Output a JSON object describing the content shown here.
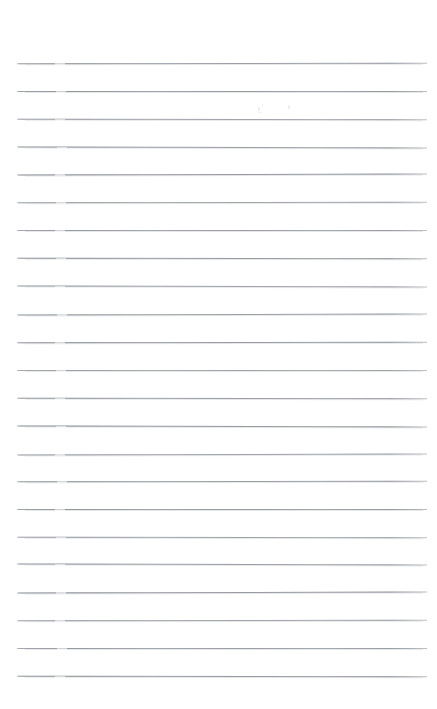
{
  "document": {
    "kind": "scanned-page",
    "title": "Blank Lined Notebook Page",
    "page_width": 437,
    "page_height": 709,
    "background_color": "#ffffff",
    "has_text_content": false,
    "has_handwriting": false,
    "visible_text": ""
  },
  "paper": {
    "surface_label": "paper-surface",
    "paper_color": "#ffffff",
    "rule_color": "#b9bdc2",
    "rule_ink_color": "#8b9096",
    "rule_thickness_px": 1,
    "rule_count": 23,
    "first_rule_y": 63,
    "last_rule_y": 676,
    "rule_spacing_px": 27.86,
    "rule_left_x": 16,
    "rule_right_x": 427,
    "has_vertical_margin_rule": false,
    "has_header_rule": false,
    "has_holes": false
  },
  "margins": {
    "top_label": "top-margin",
    "top_height_px": 63,
    "bottom_label": "bottom-margin",
    "bottom_height_px": 33,
    "left_label": "left-margin",
    "left_width_px": 16,
    "right_label": "right-margin",
    "right_width_px": 10
  },
  "rules": [
    {
      "index": 1,
      "y": 63,
      "x1": 17,
      "x2": 427,
      "nick_x": 55
    },
    {
      "index": 2,
      "y": 91,
      "x1": 17,
      "x2": 427,
      "nick_x": 56
    },
    {
      "index": 3,
      "y": 119,
      "x1": 17,
      "x2": 427,
      "nick_x": 55
    },
    {
      "index": 4,
      "y": 147,
      "x1": 17,
      "x2": 427,
      "nick_x": 57
    },
    {
      "index": 5,
      "y": 174,
      "x1": 17,
      "x2": 427,
      "nick_x": 55
    },
    {
      "index": 6,
      "y": 202,
      "x1": 17,
      "x2": 427,
      "nick_x": 56
    },
    {
      "index": 7,
      "y": 230,
      "x1": 17,
      "x2": 427,
      "nick_x": 55
    },
    {
      "index": 8,
      "y": 258,
      "x1": 17,
      "x2": 427,
      "nick_x": 56
    },
    {
      "index": 9,
      "y": 286,
      "x1": 17,
      "x2": 427,
      "nick_x": 55
    },
    {
      "index": 10,
      "y": 314,
      "x1": 17,
      "x2": 427,
      "nick_x": 57
    },
    {
      "index": 11,
      "y": 342,
      "x1": 17,
      "x2": 427,
      "nick_x": 55
    },
    {
      "index": 12,
      "y": 370,
      "x1": 17,
      "x2": 427,
      "nick_x": 56
    },
    {
      "index": 13,
      "y": 398,
      "x1": 17,
      "x2": 427,
      "nick_x": 55
    },
    {
      "index": 14,
      "y": 426,
      "x1": 17,
      "x2": 427,
      "nick_x": 56
    },
    {
      "index": 15,
      "y": 454,
      "x1": 17,
      "x2": 427,
      "nick_x": 55
    },
    {
      "index": 16,
      "y": 481,
      "x1": 17,
      "x2": 427,
      "nick_x": 57
    },
    {
      "index": 17,
      "y": 509,
      "x1": 17,
      "x2": 427,
      "nick_x": 55
    },
    {
      "index": 18,
      "y": 537,
      "x1": 17,
      "x2": 427,
      "nick_x": 56
    },
    {
      "index": 19,
      "y": 564,
      "x1": 17,
      "x2": 427,
      "nick_x": 55
    },
    {
      "index": 20,
      "y": 592,
      "x1": 17,
      "x2": 427,
      "nick_x": 56
    },
    {
      "index": 21,
      "y": 620,
      "x1": 17,
      "x2": 427,
      "nick_x": 55
    },
    {
      "index": 22,
      "y": 648,
      "x1": 17,
      "x2": 427,
      "nick_x": 57
    },
    {
      "index": 23,
      "y": 676,
      "x1": 17,
      "x2": 427,
      "nick_x": 55
    }
  ],
  "artifacts": [
    {
      "label": "scanner-speck",
      "x": 258,
      "y": 107,
      "w": 2,
      "h": 4
    },
    {
      "label": "scanner-speck",
      "x": 262,
      "y": 104,
      "w": 1,
      "h": 3
    },
    {
      "label": "scanner-speck",
      "x": 288,
      "y": 105,
      "w": 2,
      "h": 4
    },
    {
      "label": "scanner-speck",
      "x": 259,
      "y": 112,
      "w": 3,
      "h": 1
    }
  ]
}
